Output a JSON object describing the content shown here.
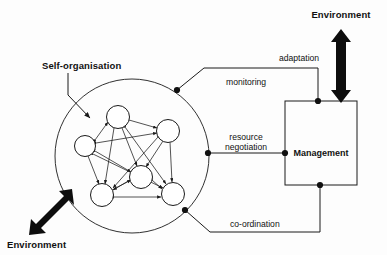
{
  "diagram": {
    "background_color": "#fdfdfd",
    "line_color": "#1a1a1a",
    "labels": {
      "self_organisation": "Self-organisation",
      "environment_top": "Environment",
      "environment_bottom": "Environment",
      "management": "Management",
      "adaptation": "adaptation",
      "monitoring": "monitoring",
      "resource_negotiation_line1": "resource",
      "resource_negotiation_line2": "negotiation",
      "coordination": "co-ordination"
    },
    "self_organisation_circle": {
      "cx": 132,
      "cy": 156,
      "r": 77
    },
    "management_box": {
      "x": 285,
      "y": 101,
      "width": 72,
      "height": 84
    },
    "network_nodes": [
      {
        "id": "n1",
        "cx": 118,
        "cy": 117,
        "r": 11.5
      },
      {
        "id": "n2",
        "cx": 85,
        "cy": 146,
        "r": 10.5
      },
      {
        "id": "n3",
        "cx": 168,
        "cy": 131,
        "r": 11.5
      },
      {
        "id": "n4",
        "cx": 141,
        "cy": 177,
        "r": 11.5
      },
      {
        "id": "n5",
        "cx": 102,
        "cy": 195,
        "r": 11.5
      },
      {
        "id": "n6",
        "cx": 173,
        "cy": 194,
        "r": 11.5
      }
    ],
    "network_edges": [
      {
        "from": "n2",
        "to": "n1",
        "bidirectional": true
      },
      {
        "from": "n1",
        "to": "n3",
        "bidirectional": true
      },
      {
        "from": "n2",
        "to": "n3",
        "bidirectional": true
      },
      {
        "from": "n1",
        "to": "n4",
        "bidirectional": true
      },
      {
        "from": "n1",
        "to": "n5",
        "bidirectional": true
      },
      {
        "from": "n1",
        "to": "n6",
        "bidirectional": true
      },
      {
        "from": "n2",
        "to": "n5",
        "bidirectional": true
      },
      {
        "from": "n2",
        "to": "n4",
        "bidirectional": true
      },
      {
        "from": "n3",
        "to": "n4",
        "bidirectional": true
      },
      {
        "from": "n3",
        "to": "n6",
        "bidirectional": true
      },
      {
        "from": "n3",
        "to": "n5",
        "bidirectional": true
      },
      {
        "from": "n4",
        "to": "n5",
        "bidirectional": true
      },
      {
        "from": "n4",
        "to": "n6",
        "bidirectional": true
      },
      {
        "from": "n5",
        "to": "n6",
        "bidirectional": true
      },
      {
        "from": "n2",
        "to": "n6",
        "bidirectional": true
      }
    ],
    "connection_dots": [
      {
        "name": "monitoring-circle-dot",
        "x": 177,
        "y": 90
      },
      {
        "name": "adaptation-box-top-dot",
        "x": 318,
        "y": 101
      },
      {
        "name": "resource-circle-dot",
        "x": 208,
        "y": 153
      },
      {
        "name": "resource-box-dot",
        "x": 285,
        "y": 153
      },
      {
        "name": "coordination-circle-dot",
        "x": 185,
        "y": 210
      },
      {
        "name": "coordination-box-dot",
        "x": 320,
        "y": 185
      }
    ]
  }
}
